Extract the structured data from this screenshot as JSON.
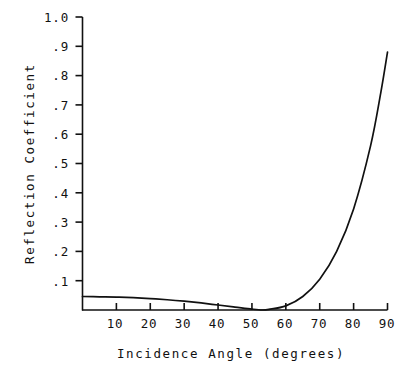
{
  "chart_data": {
    "type": "line",
    "title": "",
    "xlabel": "Incidence Angle (degrees)",
    "ylabel": "Reflection Coefficient",
    "xlim": [
      0,
      90
    ],
    "ylim": [
      0,
      1.0
    ],
    "grid": false,
    "legend": null,
    "xticks": [
      0,
      10,
      20,
      30,
      40,
      50,
      60,
      70,
      80,
      90
    ],
    "xtick_labels": [
      "",
      "10",
      "20",
      "30",
      "40",
      "50",
      "60",
      "70",
      "80",
      "90"
    ],
    "yticks": [
      0.1,
      0.2,
      0.3,
      0.4,
      0.5,
      0.6,
      0.7,
      0.8,
      0.9,
      1.0
    ],
    "ytick_labels": [
      ".1",
      ".2",
      ".3",
      ".4",
      ".5",
      ".6",
      ".7",
      ".8",
      ".9",
      "1.0"
    ],
    "line_color": "#111111",
    "series": [
      {
        "name": "Reflection Coefficient",
        "x": [
          0,
          5,
          10,
          15,
          20,
          25,
          30,
          35,
          40,
          45,
          50,
          53,
          55,
          60,
          65,
          70,
          75,
          80,
          85,
          88,
          90
        ],
        "values": [
          0.046,
          0.045,
          0.044,
          0.042,
          0.039,
          0.035,
          0.03,
          0.024,
          0.017,
          0.01,
          0.003,
          0.0,
          0.002,
          0.014,
          0.046,
          0.105,
          0.2,
          0.345,
          0.56,
          0.74,
          0.88
        ]
      }
    ],
    "annotations": [
      {
        "text": "minimum (Brewster angle) near 53 degrees",
        "x": 53,
        "y": 0.0
      },
      {
        "text": "curve terminates at 0.88 at 90 degrees",
        "x": 90,
        "y": 0.88
      }
    ]
  },
  "axes": {
    "y_title": "Reflection Coefficient",
    "x_title": "Incidence Angle (degrees)",
    "y_labels": [
      "1.0",
      ".9",
      ".8",
      ".7",
      ".6",
      ".5",
      ".4",
      ".3",
      ".2",
      ".1"
    ],
    "x_labels": [
      "10",
      "20",
      "30",
      "40",
      "50",
      "60",
      "70",
      "80",
      "90"
    ]
  },
  "colors": {
    "ink": "#111111",
    "background": "#ffffff"
  }
}
